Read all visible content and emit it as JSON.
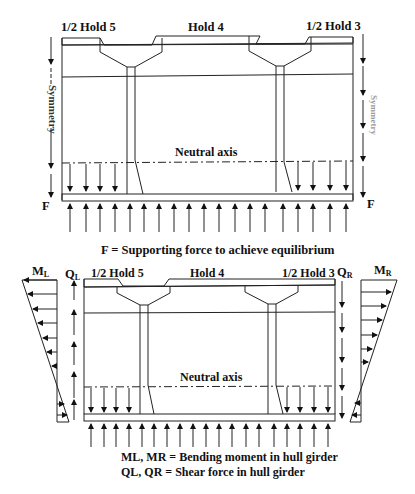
{
  "diagram": {
    "top": {
      "labels": {
        "hold_left": "1/2 Hold 5",
        "hold_mid": "Hold 4",
        "hold_right": "1/2 Hold 3",
        "symmetry_left": "Symmetry",
        "symmetry_right": "Symmetry",
        "neutral_axis": "Neutral axis",
        "force_left": "F",
        "force_right": "F"
      },
      "caption": "F = Supporting force to achieve equilibrium"
    },
    "bottom": {
      "labels": {
        "hold_left": "1/2 Hold 5",
        "hold_mid": "Hold 4",
        "hold_right": "1/2 Hold 3",
        "neutral_axis": "Neutral axis",
        "moment_left": "M",
        "moment_left_sub": "L",
        "moment_right": "M",
        "moment_right_sub": "R",
        "shear_left": "Q",
        "shear_left_sub": "L",
        "shear_right": "Q",
        "shear_right_sub": "R"
      },
      "legend": {
        "line1": "ML, MR = Bending moment in hull girder",
        "line2": "QL, QR = Shear force in hull girder"
      }
    }
  }
}
